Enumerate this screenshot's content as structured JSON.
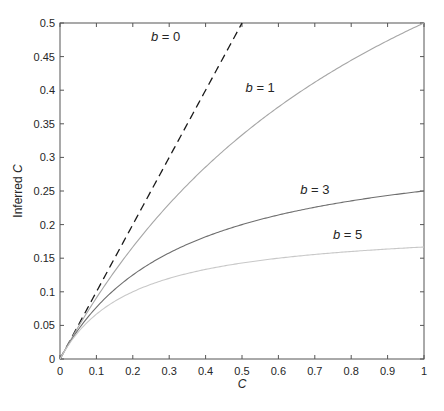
{
  "chart_data": {
    "type": "line",
    "title": "",
    "xlabel": "C",
    "ylabel": "Inferred C",
    "xlim": [
      0,
      1
    ],
    "ylim": [
      0,
      0.5
    ],
    "grid": false,
    "legend": "none (inline curve labels)",
    "x_ticks": [
      "0",
      "0.1",
      "0.2",
      "0.3",
      "0.4",
      "0.5",
      "0.6",
      "0.7",
      "0.8",
      "0.9",
      "1"
    ],
    "y_ticks": [
      "0",
      "0.05",
      "0.1",
      "0.15",
      "0.2",
      "0.25",
      "0.3",
      "0.35",
      "0.4",
      "0.45",
      "0.5"
    ],
    "x": [
      0,
      0.1,
      0.2,
      0.3,
      0.4,
      0.5,
      0.6,
      0.7,
      0.8,
      0.9,
      1.0
    ],
    "series": [
      {
        "name": "b = 0",
        "b": 0,
        "style": "dashed",
        "color": "#1a1a1a",
        "values": [
          0,
          0.1,
          0.2,
          0.3,
          0.4,
          0.5,
          null,
          null,
          null,
          null,
          null
        ]
      },
      {
        "name": "b = 1",
        "b": 1,
        "style": "solid",
        "color": "#a6a6a6",
        "values": [
          0,
          0.0909,
          0.1667,
          0.2308,
          0.2857,
          0.3333,
          0.375,
          0.4118,
          0.4444,
          0.4737,
          0.5
        ]
      },
      {
        "name": "b = 3",
        "b": 3,
        "style": "solid",
        "color": "#6e6e6e",
        "values": [
          0,
          0.0769,
          0.125,
          0.1579,
          0.1818,
          0.2,
          0.2143,
          0.2258,
          0.2353,
          0.2432,
          0.25
        ]
      },
      {
        "name": "b = 5",
        "b": 5,
        "style": "solid",
        "color": "#c8c8c8",
        "values": [
          0,
          0.0667,
          0.1,
          0.12,
          0.1333,
          0.1429,
          0.15,
          0.1556,
          0.16,
          0.1636,
          0.1667
        ]
      }
    ],
    "annotations": [
      {
        "text": "b = 0",
        "x": 0.29,
        "y": 0.473
      },
      {
        "text": "b = 1",
        "x": 0.55,
        "y": 0.398
      },
      {
        "text": "b = 3",
        "x": 0.7,
        "y": 0.246
      },
      {
        "text": "b = 5",
        "x": 0.79,
        "y": 0.178
      }
    ]
  }
}
